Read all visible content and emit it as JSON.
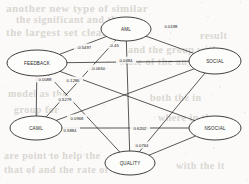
{
  "figure": {
    "type": "path-diagram",
    "background_color": "#fbfaf8",
    "node_fill": "#fdfdfc",
    "stroke_color": "#222222"
  },
  "nodes": [
    {
      "id": "AML",
      "label": "AML",
      "cx": 126,
      "cy": 29,
      "rx": 25,
      "ry": 12
    },
    {
      "id": "SOCIAL",
      "label": "SOCIAL",
      "cx": 215,
      "cy": 61,
      "rx": 26,
      "ry": 13
    },
    {
      "id": "FEEDBACK",
      "label": "FEEDBACK",
      "cx": 37,
      "cy": 63,
      "rx": 30,
      "ry": 13
    },
    {
      "id": "CAWL",
      "label": "CAWL",
      "cx": 36,
      "cy": 128,
      "rx": 26,
      "ry": 12
    },
    {
      "id": "NSOCIAL",
      "label": "NSOCIAL",
      "cx": 215,
      "cy": 128,
      "rx": 26,
      "ry": 12
    },
    {
      "id": "QUALITY",
      "label": "QUALITY",
      "cx": 130,
      "cy": 163,
      "rx": 25,
      "ry": 12
    }
  ],
  "edges": [
    {
      "from": "AML",
      "to": "SOCIAL",
      "weight": "0.0198",
      "lx": 171,
      "ly": 26
    },
    {
      "from": "FEEDBACK",
      "to": "AML",
      "weight": "-0.5497",
      "lx": 84,
      "ly": 47
    },
    {
      "from": "AML",
      "to": "CAWL",
      "weight": "-0.45",
      "lx": 114,
      "ly": 45
    },
    {
      "from": "AML",
      "to": "QUALITY",
      "weight": "0.0484",
      "lx": 126,
      "ly": 60
    },
    {
      "from": "FEEDBACK",
      "to": "SOCIAL",
      "weight": "-0.0650",
      "lx": 98,
      "ly": 68
    },
    {
      "from": "FEEDBACK",
      "to": "CAWL",
      "weight": "0.0088",
      "lx": 45,
      "ly": 79
    },
    {
      "from": "FEEDBACK",
      "to": "NSOCIAL",
      "weight": "0.1286",
      "lx": 73,
      "ly": 80
    },
    {
      "from": "FEEDBACK",
      "to": "QUALITY",
      "weight": "0.5279",
      "lx": 65,
      "ly": 99
    },
    {
      "from": "CAWL",
      "to": "SOCIAL",
      "weight": "0.0968",
      "lx": 77,
      "ly": 118
    },
    {
      "from": "CAWL",
      "to": "NSOCIAL",
      "weight": "0.5884",
      "lx": 70,
      "ly": 130
    },
    {
      "from": "SOCIAL",
      "to": "QUALITY",
      "weight": "0.6202",
      "lx": 140,
      "ly": 128
    },
    {
      "from": "NSOCIAL",
      "to": "QUALITY",
      "weight": "0.0764",
      "lx": 142,
      "ly": 145
    }
  ],
  "bleed_text": [
    {
      "text": "another new type of similar",
      "x": 6,
      "y": 2,
      "size": 11
    },
    {
      "text": "the significant and that",
      "x": 16,
      "y": 14,
      "size": 10
    },
    {
      "text": "the largest set clear",
      "x": 6,
      "y": 26,
      "size": 11
    },
    {
      "text": "result",
      "x": 200,
      "y": 30,
      "size": 10
    },
    {
      "text": "and the group with",
      "x": 128,
      "y": 44,
      "size": 10
    },
    {
      "text": "state of the any display",
      "x": 120,
      "y": 56,
      "size": 10
    },
    {
      "text": "model as the",
      "x": 8,
      "y": 88,
      "size": 10
    },
    {
      "text": "both the in",
      "x": 150,
      "y": 92,
      "size": 10
    },
    {
      "text": "group for",
      "x": 14,
      "y": 104,
      "size": 10
    },
    {
      "text": "where in the",
      "x": 158,
      "y": 112,
      "size": 10
    },
    {
      "text": "are point to help the",
      "x": 4,
      "y": 150,
      "size": 10
    },
    {
      "text": "that of and the rate of",
      "x": 4,
      "y": 164,
      "size": 10
    },
    {
      "text": "with the it",
      "x": 176,
      "y": 160,
      "size": 10
    }
  ]
}
